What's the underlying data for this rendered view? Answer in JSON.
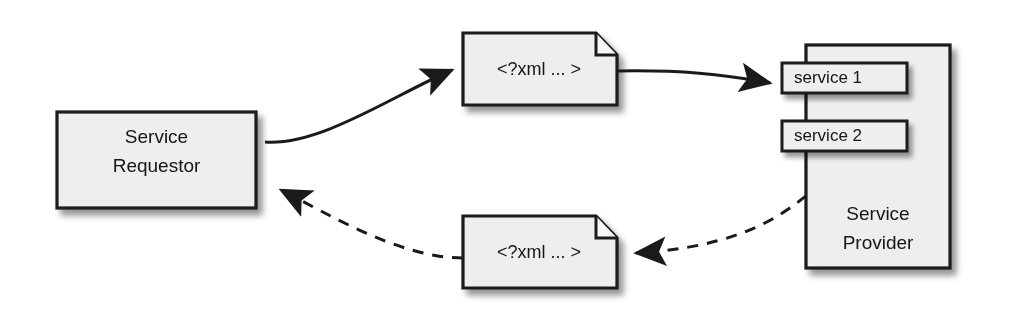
{
  "diagram": {
    "background_color": "#ffffff",
    "shape_fill": "#eeeeee",
    "shape_stroke": "#1a1a1a",
    "shadow_color": "#bdbdbd",
    "text_color": "#141414",
    "nodes": {
      "requestor": {
        "line1": "Service",
        "line2": "Requestor"
      },
      "provider": {
        "line1": "Service",
        "line2": "Provider"
      },
      "service_1": {
        "label": "service 1"
      },
      "service_2": {
        "label": "service 2"
      },
      "request_document": {
        "label": "<?xml ... >"
      },
      "response_document": {
        "label": "<?xml ... >"
      }
    },
    "connectors": [
      {
        "name": "requestor-to-request-doc",
        "style": "solid",
        "direction": "right",
        "from": "requestor",
        "to": "request_document"
      },
      {
        "name": "request-doc-to-service-1",
        "style": "solid",
        "direction": "right",
        "from": "request_document",
        "to": "service_1"
      },
      {
        "name": "provider-to-response-doc",
        "style": "dashed",
        "direction": "left",
        "from": "provider",
        "to": "response_document"
      },
      {
        "name": "response-doc-to-requestor",
        "style": "dashed",
        "direction": "left",
        "from": "response_document",
        "to": "requestor"
      }
    ]
  }
}
